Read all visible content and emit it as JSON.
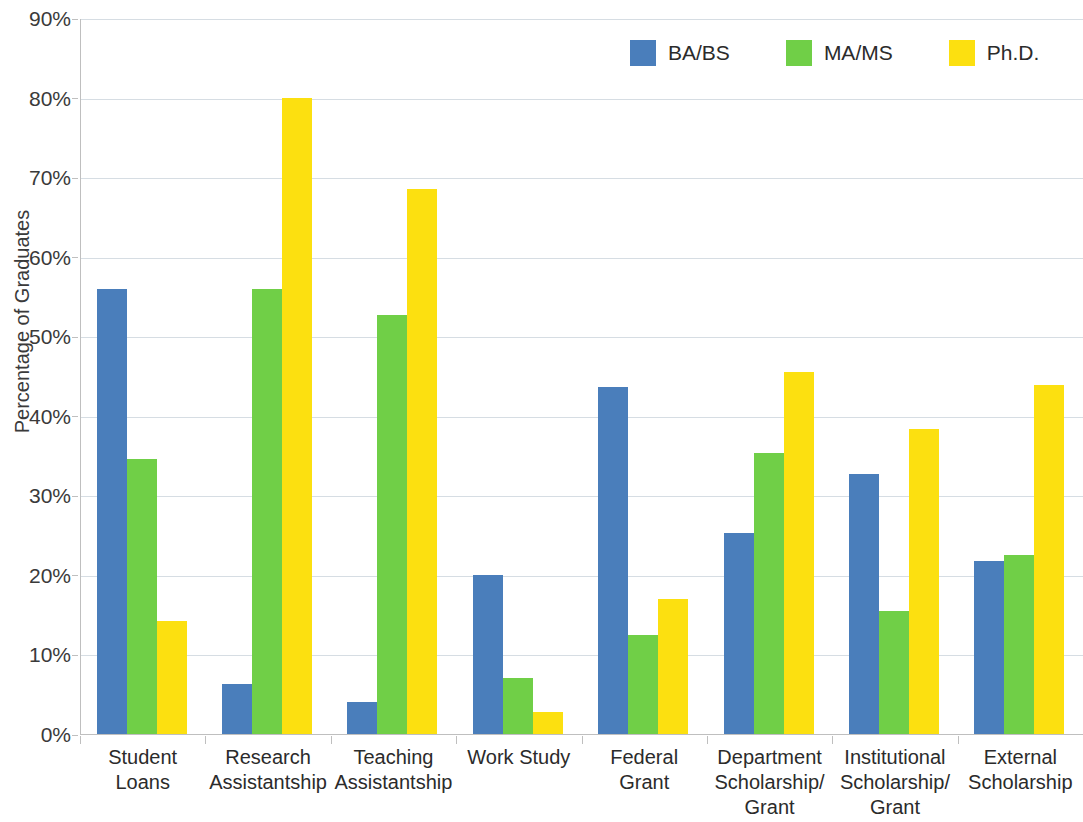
{
  "chart_data": {
    "type": "bar",
    "title": "",
    "xlabel": "",
    "ylabel": "Percentage of Graduates",
    "ylim": [
      0,
      90
    ],
    "ytick_step": 10,
    "ytick_labels": [
      "0%",
      "10%",
      "20%",
      "30%",
      "40%",
      "50%",
      "60%",
      "70%",
      "80%",
      "90%"
    ],
    "ytick_values": [
      0,
      10,
      20,
      30,
      40,
      50,
      60,
      70,
      80,
      90
    ],
    "grid": true,
    "legend_position": "top-right",
    "value_unit": "percent",
    "categories": [
      "Student Loans",
      "Research Assistantship",
      "Teaching Assistantship",
      "Work Study",
      "Federal Grant",
      "Department Scholarship/ Grant",
      "Institutional Scholarship/ Grant",
      "External Scholarship"
    ],
    "category_lines": [
      [
        "Student Loans"
      ],
      [
        "Research",
        "Assistantship"
      ],
      [
        "Teaching",
        "Assistantship"
      ],
      [
        "Work Study"
      ],
      [
        "Federal",
        "Grant"
      ],
      [
        "Department",
        "Scholarship/",
        "Grant"
      ],
      [
        "Institutional",
        "Scholarship/",
        "Grant"
      ],
      [
        "External",
        "Scholarship"
      ]
    ],
    "series": [
      {
        "name": "BA/BS",
        "color": "#4a7ebb",
        "values": [
          56.0,
          6.3,
          4.0,
          20.0,
          43.6,
          25.3,
          32.7,
          21.7
        ]
      },
      {
        "name": "MA/MS",
        "color": "#70cf47",
        "values": [
          34.6,
          56.0,
          52.7,
          7.0,
          12.4,
          35.3,
          15.5,
          22.5
        ]
      },
      {
        "name": "Ph.D.",
        "color": "#fce010",
        "values": [
          14.2,
          80.0,
          68.5,
          2.8,
          17.0,
          45.5,
          38.3,
          43.9
        ]
      }
    ]
  },
  "legend": {
    "items": [
      {
        "label": "BA/BS",
        "color": "#4a7ebb"
      },
      {
        "label": "MA/MS",
        "color": "#70cf47"
      },
      {
        "label": "Ph.D.",
        "color": "#fce010"
      }
    ]
  },
  "axis": {
    "y_title": "Percentage of Graduates"
  }
}
